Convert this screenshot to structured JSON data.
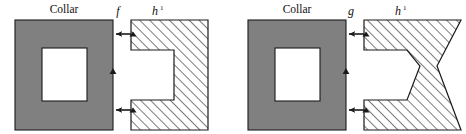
{
  "figure": {
    "title": "",
    "background_color": "#ffffff",
    "stroke_color": "#1a1a1a",
    "collar_fill": "#808080",
    "hole_fill": "#ffffff",
    "hatch_fill": "#ffffff",
    "hatch_line_color": "#1a1a1a"
  },
  "panels": [
    {
      "id": "left-panel",
      "collar_label": "Collar",
      "map_label": "f",
      "part_label": "h",
      "part_label_superscript": "1",
      "part_shape": "c-shape-rectangular-notch",
      "arrows": [
        {
          "name": "top-arrow",
          "direction": "left"
        },
        {
          "name": "bottom-arrow",
          "direction": "left"
        },
        {
          "name": "edge-marker",
          "direction": "up"
        }
      ]
    },
    {
      "id": "right-panel",
      "collar_label": "Collar",
      "map_label": "g",
      "part_label": "h",
      "part_label_superscript": "1",
      "part_shape": "c-shape-bowtie-notch",
      "arrows": [
        {
          "name": "top-arrow",
          "direction": "left"
        },
        {
          "name": "bottom-arrow",
          "direction": "left"
        },
        {
          "name": "edge-marker",
          "direction": "up"
        }
      ]
    }
  ]
}
